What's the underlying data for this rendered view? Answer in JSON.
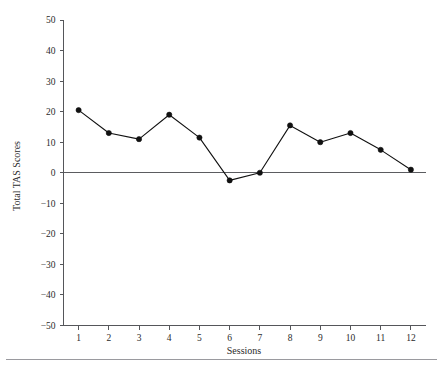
{
  "chart_data": {
    "type": "line",
    "title": "",
    "xlabel": "Sessions",
    "ylabel": "Total TAS Scores",
    "categories": [
      1,
      2,
      3,
      4,
      5,
      6,
      7,
      8,
      9,
      10,
      11,
      12
    ],
    "x_tick_labels": [
      "1",
      "2",
      "3",
      "4",
      "5",
      "6",
      "7",
      "8",
      "9",
      "10",
      "11",
      "12"
    ],
    "y_tick_labels": [
      "50",
      "40",
      "30",
      "20",
      "10",
      "0",
      "−10",
      "−20",
      "−30",
      "−40",
      "−50"
    ],
    "y_tick_values": [
      50,
      40,
      30,
      20,
      10,
      0,
      -10,
      -20,
      -30,
      -40,
      -50
    ],
    "values": [
      20.5,
      13,
      11,
      19,
      11.5,
      -2.5,
      0,
      15.5,
      10,
      13,
      7.5,
      1
    ],
    "series": [
      {
        "name": "Total TAS Scores",
        "values": [
          20.5,
          13,
          11,
          19,
          11.5,
          -2.5,
          0,
          15.5,
          10,
          13,
          7.5,
          1
        ]
      }
    ],
    "xlim": [
      0.5,
      12.5
    ],
    "ylim": [
      -50,
      50
    ],
    "grid": false,
    "legend": false,
    "marker": "filled-circle",
    "line_color": "#111111",
    "marker_color": "#111111",
    "axis_color": "#55565a",
    "zero_line": true,
    "background": "#ffffff"
  },
  "footer": {
    "rule": ""
  }
}
